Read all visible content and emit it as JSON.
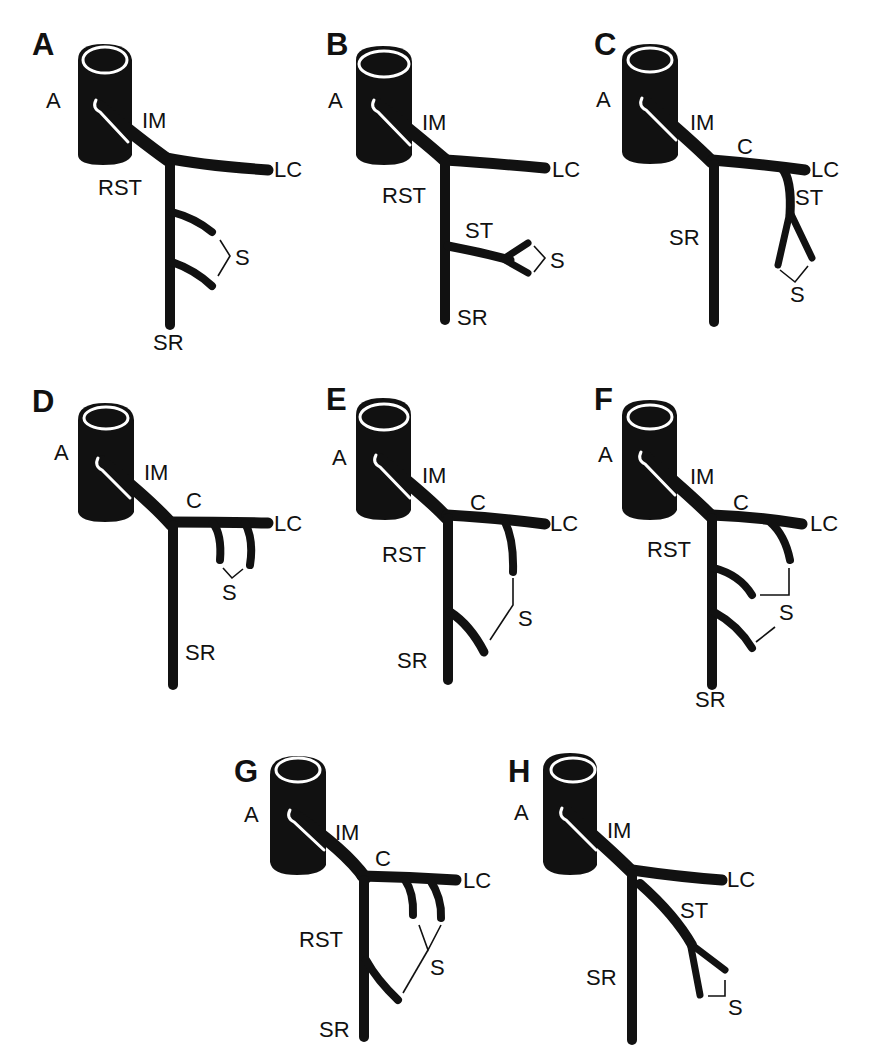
{
  "figure": {
    "panels": [
      {
        "id": "A",
        "letter": "A",
        "labels": {
          "aorta": "A",
          "im": "IM",
          "lc": "LC",
          "rst": "RST",
          "s": "S",
          "sr": "SR"
        }
      },
      {
        "id": "B",
        "letter": "B",
        "labels": {
          "aorta": "A",
          "im": "IM",
          "lc": "LC",
          "rst": "RST",
          "st": "ST",
          "s": "S",
          "sr": "SR"
        }
      },
      {
        "id": "C",
        "letter": "C",
        "labels": {
          "aorta": "A",
          "im": "IM",
          "c": "C",
          "lc": "LC",
          "st": "ST",
          "sr": "SR",
          "s": "S"
        }
      },
      {
        "id": "D",
        "letter": "D",
        "labels": {
          "aorta": "A",
          "im": "IM",
          "c": "C",
          "lc": "LC",
          "s": "S",
          "sr": "SR"
        }
      },
      {
        "id": "E",
        "letter": "E",
        "labels": {
          "aorta": "A",
          "im": "IM",
          "c": "C",
          "lc": "LC",
          "rst": "RST",
          "s": "S",
          "sr": "SR"
        }
      },
      {
        "id": "F",
        "letter": "F",
        "labels": {
          "aorta": "A",
          "im": "IM",
          "c": "C",
          "lc": "LC",
          "rst": "RST",
          "s": "S",
          "sr": "SR"
        }
      },
      {
        "id": "G",
        "letter": "G",
        "labels": {
          "aorta": "A",
          "im": "IM",
          "c": "C",
          "lc": "LC",
          "rst": "RST",
          "s": "S",
          "sr": "SR"
        }
      },
      {
        "id": "H",
        "letter": "H",
        "labels": {
          "aorta": "A",
          "im": "IM",
          "lc": "LC",
          "st": "ST",
          "sr": "SR",
          "s": "S"
        }
      }
    ]
  }
}
